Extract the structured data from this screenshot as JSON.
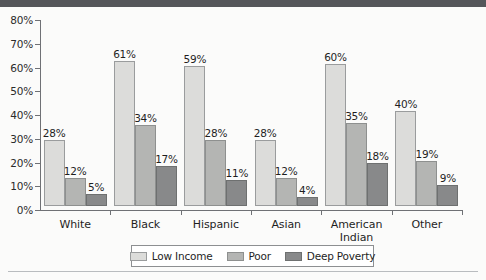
{
  "chart_data": {
    "type": "bar",
    "title": "",
    "subtitle": "",
    "xlabel": "",
    "ylabel": "",
    "ylim": [
      0,
      80
    ],
    "grid": false,
    "legend_position": "bottom",
    "ytick_labels": [
      "80%",
      "70%",
      "60%",
      "50%",
      "40%",
      "30%",
      "20%",
      "10%",
      "0%"
    ],
    "ytick_values": [
      80,
      70,
      60,
      50,
      40,
      30,
      20,
      10,
      0
    ],
    "categories": [
      "White",
      "Black",
      "Hispanic",
      "Asian",
      "American Indian",
      "Other"
    ],
    "series": [
      {
        "name": "Low Income",
        "color": "#dcdcda",
        "values": [
          28,
          61,
          59,
          28,
          60,
          40
        ],
        "labels": [
          "28%",
          "61%",
          "59%",
          "28%",
          "60%",
          "40%"
        ]
      },
      {
        "name": "Poor",
        "color": "#b4b5b3",
        "values": [
          12,
          34,
          28,
          12,
          35,
          19
        ],
        "labels": [
          "12%",
          "34%",
          "28%",
          "12%",
          "35%",
          "19%"
        ]
      },
      {
        "name": "Deep Poverty",
        "color": "#88898a",
        "values": [
          5,
          17,
          11,
          4,
          18,
          9
        ],
        "labels": [
          "5%",
          "17%",
          "11%",
          "4%",
          "18%",
          "9%"
        ]
      }
    ]
  },
  "axis": {
    "y_ticks": [
      "80%",
      "70%",
      "60%",
      "50%",
      "40%",
      "30%",
      "20%",
      "10%",
      "0%"
    ],
    "categories": [
      {
        "line1": "White",
        "line2": ""
      },
      {
        "line1": "Black",
        "line2": ""
      },
      {
        "line1": "Hispanic",
        "line2": ""
      },
      {
        "line1": "Asian",
        "line2": ""
      },
      {
        "line1": "American",
        "line2": "Indian"
      },
      {
        "line1": "Other",
        "line2": ""
      }
    ]
  },
  "legend": {
    "items": [
      {
        "label": "Low Income"
      },
      {
        "label": "Poor"
      },
      {
        "label": "Deep Poverty"
      }
    ]
  }
}
